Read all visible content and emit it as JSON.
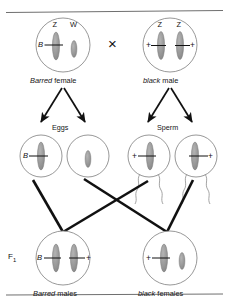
{
  "figure": {
    "type": "genetic-cross-diagram",
    "topic": "ZW sex-linked inheritance of barring in chickens",
    "cross_symbol": "×",
    "colors": {
      "chromosome_fill": "#9a9a9a",
      "chromosome_stroke": "#7d7d7d",
      "cell_outline": "#8c8c8c",
      "arrow": "#111111",
      "cross_line": "#111111",
      "rule": "#6f6f6f",
      "text": "#151515"
    }
  },
  "rules": {
    "top": "horizontal-rule",
    "bottom": "horizontal-rule"
  },
  "parents": {
    "cross_symbol": "×",
    "female": {
      "caption_italic": "Barred",
      "caption_rest": "female",
      "chromosomes": [
        {
          "name": "Z",
          "allele": "B",
          "allele_side": "left",
          "size": "large"
        },
        {
          "name": "W",
          "allele": "",
          "allele_side": "none",
          "size": "small"
        }
      ]
    },
    "male": {
      "caption_italic": "black",
      "caption_rest": "male",
      "chromosomes": [
        {
          "name": "Z",
          "allele": "+",
          "allele_side": "left",
          "size": "large"
        },
        {
          "name": "Z",
          "allele": "+",
          "allele_side": "right",
          "size": "large"
        }
      ]
    }
  },
  "gametes": {
    "eggs": {
      "label": "Eggs",
      "cells": [
        {
          "allele": "B",
          "allele_side": "left",
          "size": "large"
        },
        {
          "allele": "",
          "allele_side": "none",
          "size": "small"
        }
      ]
    },
    "sperm": {
      "label": "Sperm",
      "cells": [
        {
          "allele": "+",
          "allele_side": "left",
          "size": "large"
        },
        {
          "allele": "+",
          "allele_side": "right",
          "size": "large"
        }
      ]
    }
  },
  "f1": {
    "label": "F",
    "label_sub": "1",
    "offspring": [
      {
        "caption_italic": "Barred",
        "caption_rest": "males",
        "chromosomes": [
          {
            "allele": "B",
            "allele_side": "left",
            "size": "large"
          },
          {
            "allele": "+",
            "allele_side": "right",
            "size": "large"
          }
        ]
      },
      {
        "caption_italic": "black",
        "caption_rest": "females",
        "chromosomes": [
          {
            "allele": "+",
            "allele_side": "left",
            "size": "large"
          },
          {
            "allele": "",
            "allele_side": "none",
            "size": "small"
          }
        ]
      }
    ]
  }
}
